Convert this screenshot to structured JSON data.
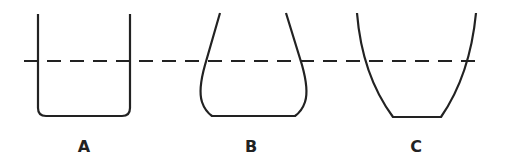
{
  "containers": [
    {
      "label": "A",
      "shape": "straight-walled beaker"
    },
    {
      "label": "B",
      "shape": "narrowing flask (wide bottom, tapered top)"
    },
    {
      "label": "C",
      "shape": "widening vessel (narrow bottom, flared top)"
    }
  ],
  "colors": {
    "stroke": "#222222",
    "background": "#ffffff"
  },
  "liquid_level_line": "dashed"
}
